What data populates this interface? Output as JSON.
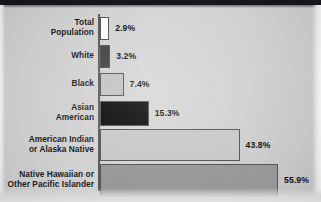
{
  "figure": {
    "background_color": "#d0d0d0",
    "axis_color": "#5a5a5a",
    "top_band_color": "#16171a"
  },
  "chart_data": {
    "type": "bar",
    "orientation": "horizontal",
    "title": "",
    "subtitle": "",
    "xlabel": "",
    "ylabel": "",
    "xlim": [
      0,
      60
    ],
    "grid": false,
    "legend": "none",
    "value_suffix": "%",
    "categories": [
      "Total\nPopulation",
      "White",
      "Black",
      "Asian\nAmerican",
      "American Indian\nor Alaska Native",
      "Native Hawaiian or\nOther Pacific Islander"
    ],
    "values": [
      2.9,
      3.2,
      7.4,
      15.3,
      43.8,
      55.9
    ],
    "value_labels": [
      "2.9%",
      "3.2%",
      "7.4%",
      "15.3%",
      "43.8%",
      "55.9%"
    ],
    "bar_colors": [
      "#fbfbfb",
      "#414141",
      "#c2c2c2",
      "#080808",
      "#c8c8c8",
      "#999999"
    ],
    "bar_border_color": "#555555"
  },
  "bars": [
    {
      "label": "Total\nPopulation",
      "value": 2.9,
      "value_label": "2.9%",
      "color": "#fbfbfb"
    },
    {
      "label": "White",
      "value": 3.2,
      "value_label": "3.2%",
      "color": "#414141"
    },
    {
      "label": "Black",
      "value": 7.4,
      "value_label": "7.4%",
      "color": "#c2c2c2"
    },
    {
      "label": "Asian\nAmerican",
      "value": 15.3,
      "value_label": "15.3%",
      "color": "#080808"
    },
    {
      "label": "American Indian\nor Alaska Native",
      "value": 43.8,
      "value_label": "43.8%",
      "color": "#c8c8c8"
    },
    {
      "label": "Native Hawaiian or\nOther Pacific Islander",
      "value": 55.9,
      "value_label": "55.9%",
      "color": "#999999"
    }
  ]
}
